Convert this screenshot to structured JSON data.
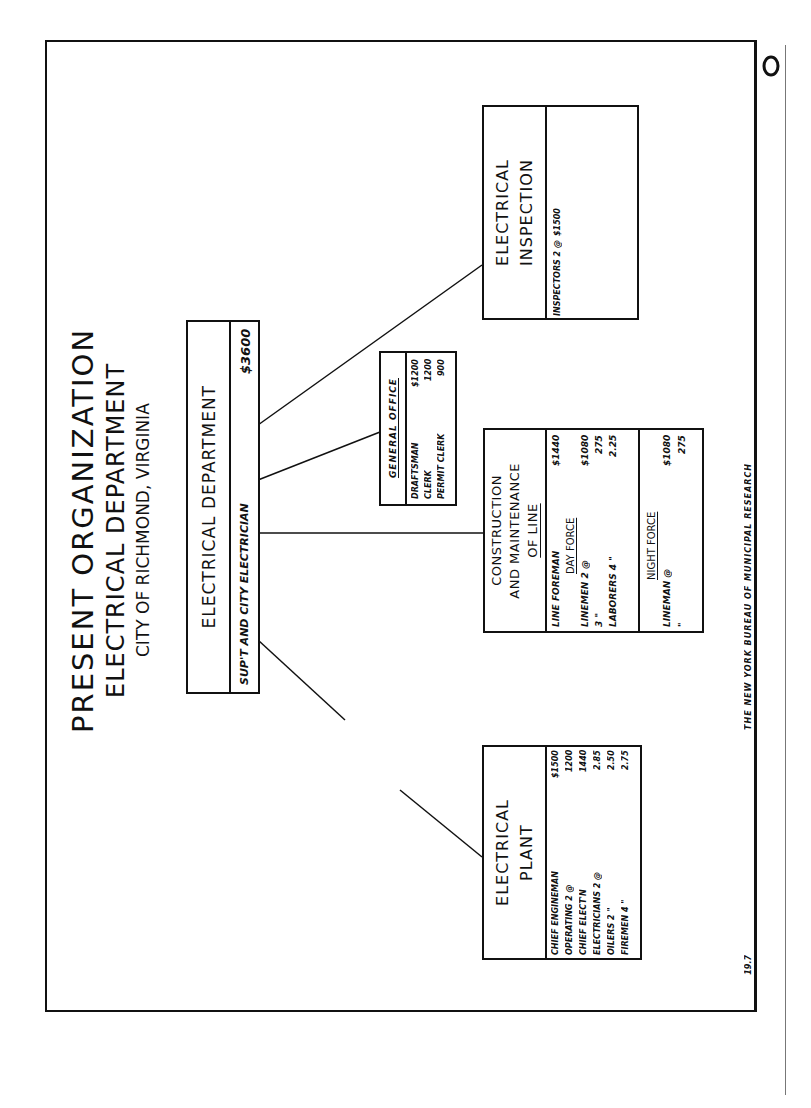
{
  "title": {
    "line1": "PRESENT ORGANIZATION",
    "line2": "ELECTRICAL DEPARTMENT",
    "line3": "CITY OF RICHMOND, VIRGINIA"
  },
  "corner_mark": "O",
  "root": {
    "name": "ELECTRICAL DEPARTMENT",
    "position": "SUP'T AND CITY ELECTRICIAN",
    "salary": "$3600"
  },
  "general_office": {
    "name": "GENERAL OFFICE",
    "staff": [
      {
        "title": "DRAFTSMAN",
        "salary": "$1200"
      },
      {
        "title": "CLERK",
        "salary": "1200"
      },
      {
        "title": "PERMIT CLERK",
        "salary": "900"
      }
    ]
  },
  "electrical_inspection": {
    "name_line1": "ELECTRICAL",
    "name_line2": "INSPECTION",
    "staff": [
      {
        "title": "INSPECTORS 2 @",
        "salary": "$1500"
      }
    ]
  },
  "construction": {
    "name_line1": "CONSTRUCTION",
    "name_line2": "AND MAINTENANCE",
    "name_line3": "OF LINE",
    "foreman": {
      "title": "LINE FOREMAN",
      "salary": "$1440"
    },
    "day_force": {
      "label": "DAY FORCE",
      "rows": [
        {
          "title": "LINEMEN 2 @",
          "salary": "$1080"
        },
        {
          "title": "3 \"",
          "salary": "275"
        },
        {
          "title": "LABORERS 4 \"",
          "salary": "2.25"
        }
      ]
    },
    "night_force": {
      "label": "NIGHT FORCE",
      "rows": [
        {
          "title": "LINEMAN @",
          "salary": "$1080"
        },
        {
          "title": "\"",
          "salary": "275"
        }
      ]
    }
  },
  "electrical_plant": {
    "name_line1": "ELECTRICAL",
    "name_line2": "PLANT",
    "staff": [
      {
        "title": "CHIEF ENGINEMAN",
        "salary": "$1500"
      },
      {
        "title": "OPERATING 2 @",
        "salary": "1200"
      },
      {
        "title": "CHIEF ELECT'N",
        "salary": "1440"
      },
      {
        "title": "ELECTRICIANS 2 @",
        "salary": "2.85"
      },
      {
        "title": "OILERS 2 \"",
        "salary": "2.50"
      },
      {
        "title": "FIREMEN 4 \"",
        "salary": "2.75"
      }
    ]
  },
  "footer": {
    "credit": "THE NEW YORK BUREAU OF MUNICIPAL RESEARCH",
    "page_number": "19.7"
  },
  "colors": {
    "ink": "#111111",
    "paper": "#ffffff"
  }
}
